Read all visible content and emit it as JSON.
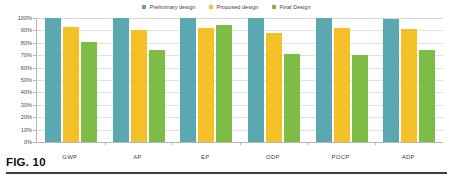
{
  "figure": {
    "caption": "FIG. 10"
  },
  "legend": {
    "position": "top-center",
    "items": [
      {
        "label": "Preliminary design",
        "color": "#5aa8b0"
      },
      {
        "label": "Proposed design",
        "color": "#f4c028"
      },
      {
        "label": "Final Design",
        "color": "#7dbd45"
      }
    ]
  },
  "axes": {
    "y_ticks": [
      "100%",
      "90%",
      "80%",
      "70%",
      "60%",
      "50%",
      "40%",
      "30%",
      "20%",
      "10%",
      "0%"
    ],
    "x_categories": [
      "GWP",
      "AP",
      "EP",
      "ODP",
      "POCP",
      "ADP"
    ]
  },
  "chart_data": {
    "type": "bar",
    "title": "FIG. 10",
    "xlabel": "",
    "ylabel": "",
    "ylim": [
      0,
      100
    ],
    "ytick_step": 10,
    "ytick_format": "percent",
    "grid": true,
    "legend_position": "top-center",
    "categories": [
      "GWP",
      "AP",
      "EP",
      "ODP",
      "POCP",
      "ADP"
    ],
    "series": [
      {
        "name": "Preliminary design",
        "color": "#5aa8b0",
        "values": [
          100,
          100,
          100,
          100,
          100,
          99
        ]
      },
      {
        "name": "Proposed design",
        "color": "#f4c028",
        "values": [
          93,
          90,
          92,
          88,
          92,
          91
        ]
      },
      {
        "name": "Final Design",
        "color": "#7dbd45",
        "values": [
          81,
          74,
          94,
          71,
          70,
          74
        ]
      }
    ]
  }
}
